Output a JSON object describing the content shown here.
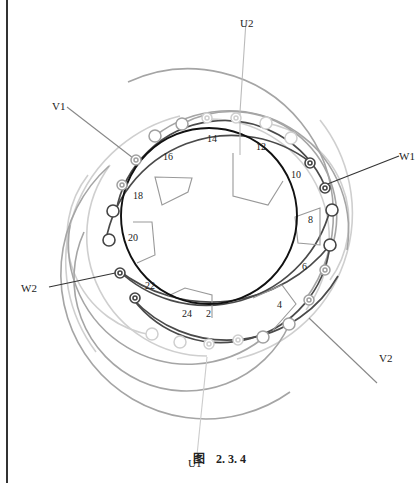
{
  "figure": {
    "caption_prefix": "图",
    "caption_number": "2. 3. 4"
  },
  "terminals": {
    "U1": "U1",
    "U2": "U2",
    "V1": "V1",
    "V2": "V2",
    "W1": "W1",
    "W2": "W2"
  },
  "slot_numbers": [
    "2",
    "4",
    "6",
    "8",
    "10",
    "12",
    "14",
    "16",
    "18",
    "20",
    "22",
    "24"
  ],
  "colors": {
    "phase_u": "#c8c8c8",
    "phase_v": "#9a9a9a",
    "phase_w": "#555555",
    "stator_circle": "#111111"
  }
}
